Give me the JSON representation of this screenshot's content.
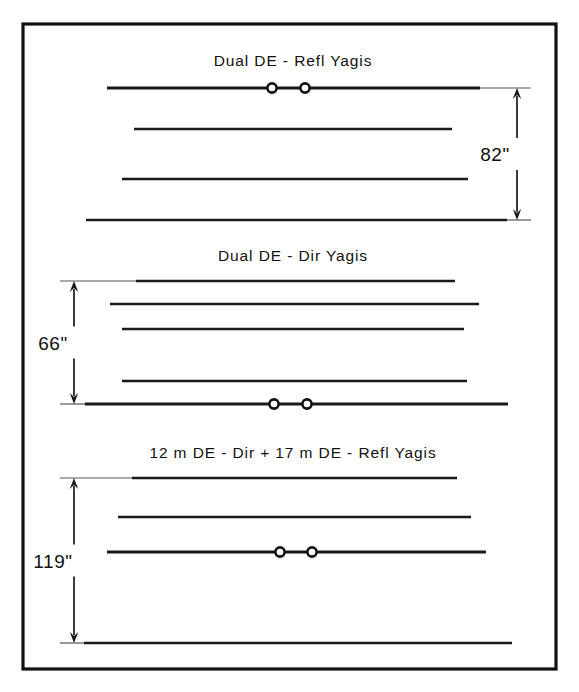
{
  "figure": {
    "name": "yagi-stacking-diagram",
    "background_color": "#ffffff",
    "line_color": "#1a1a1a",
    "frame": {
      "x": 23,
      "y": 24,
      "width": 533,
      "height": 645
    }
  },
  "panels": [
    {
      "id": "panel-dual-de-refl",
      "title": "Dual DE - Refl  Yagis",
      "dimension": {
        "label": "82\"",
        "value": 82,
        "unit": "inches",
        "side": "right",
        "x": 517,
        "y_top": 88,
        "y_bottom": 220
      },
      "booms": [
        {
          "name": "driven-element-boom",
          "y": 88,
          "x1": 107,
          "x2": 480,
          "is_boom": true,
          "feedpoints": [
            {
              "cx": 272,
              "cy": 88,
              "r": 4.6
            },
            {
              "cx": 305,
              "cy": 88,
              "r": 4.6
            }
          ]
        },
        {
          "name": "element-2",
          "y": 129,
          "x1": 134,
          "x2": 452,
          "is_boom": false,
          "feedpoints": []
        },
        {
          "name": "element-3",
          "y": 179,
          "x1": 122,
          "x2": 468,
          "is_boom": false,
          "feedpoints": []
        },
        {
          "name": "element-4",
          "y": 220,
          "x1": 86,
          "x2": 507,
          "is_boom": false,
          "feedpoints": []
        }
      ],
      "title_pos": {
        "x": 293,
        "y": 66
      }
    },
    {
      "id": "panel-dual-de-dir",
      "title": "Dual DE - Dir  Yagis",
      "dimension": {
        "label": "66\"",
        "value": 66,
        "unit": "inches",
        "side": "left",
        "x": 74,
        "y_top": 281,
        "y_bottom": 404
      },
      "booms": [
        {
          "name": "element-1",
          "y": 281,
          "x1": 136,
          "x2": 455,
          "is_boom": false,
          "feedpoints": []
        },
        {
          "name": "element-2",
          "y": 304,
          "x1": 110,
          "x2": 479,
          "is_boom": false,
          "feedpoints": []
        },
        {
          "name": "element-3",
          "y": 329,
          "x1": 122,
          "x2": 464,
          "is_boom": false,
          "feedpoints": []
        },
        {
          "name": "element-4",
          "y": 381,
          "x1": 122,
          "x2": 467,
          "is_boom": false,
          "feedpoints": []
        },
        {
          "name": "driven-element-boom",
          "y": 404,
          "x1": 85,
          "x2": 508,
          "is_boom": true,
          "feedpoints": [
            {
              "cx": 274,
              "cy": 404,
              "r": 4.6
            },
            {
              "cx": 307,
              "cy": 404,
              "r": 4.6
            }
          ]
        }
      ],
      "title_pos": {
        "x": 293,
        "y": 261
      }
    },
    {
      "id": "panel-12m-dir-17m-refl",
      "title": "12 m DE - Dir  +  17 m DE - Refl  Yagis",
      "dimension": {
        "label": "119\"",
        "value": 119,
        "unit": "inches",
        "side": "left",
        "x": 74,
        "y_top": 478,
        "y_bottom": 643
      },
      "booms": [
        {
          "name": "element-1",
          "y": 478,
          "x1": 132,
          "x2": 457,
          "is_boom": false,
          "feedpoints": []
        },
        {
          "name": "element-2",
          "y": 517,
          "x1": 118,
          "x2": 471,
          "is_boom": false,
          "feedpoints": []
        },
        {
          "name": "driven-element-boom",
          "y": 552,
          "x1": 107,
          "x2": 486,
          "is_boom": true,
          "feedpoints": [
            {
              "cx": 280,
              "cy": 552,
              "r": 4.6
            },
            {
              "cx": 312,
              "cy": 552,
              "r": 4.6
            }
          ]
        },
        {
          "name": "element-4",
          "y": 643,
          "x1": 84,
          "x2": 512,
          "is_boom": false,
          "feedpoints": []
        }
      ],
      "title_pos": {
        "x": 293,
        "y": 458
      }
    }
  ]
}
